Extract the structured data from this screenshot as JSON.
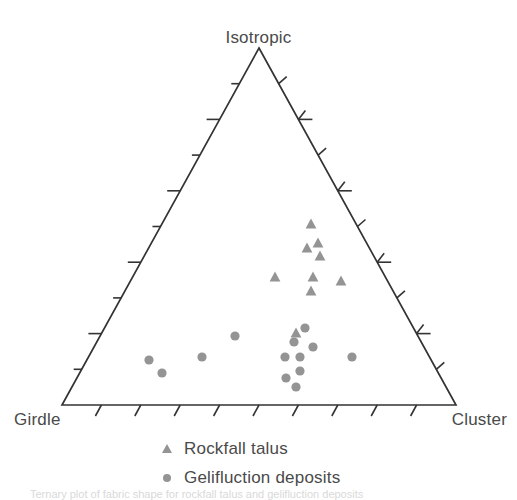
{
  "figure": {
    "type": "ternary-scatter",
    "vertices": {
      "top": "Isotropic",
      "bottom_left": "Girdle",
      "bottom_right": "Cluster"
    },
    "caption_partial": "Ternary plot of fabric shape for rockfall talus and gelifluction deposits"
  },
  "legend": {
    "items": [
      {
        "marker": "triangle-marker",
        "label": "Rockfall talus",
        "color": "#949494"
      },
      {
        "marker": "circle-marker",
        "label": "Gelifluction deposits",
        "color": "#949494"
      }
    ]
  },
  "style": {
    "axis_color": "#333333",
    "marker_gray": "#949494",
    "text_gray": "#4a4a4a",
    "background": "#ffffff"
  },
  "chart_data": {
    "type": "scatter",
    "plot_kind": "ternary",
    "title": "",
    "axis_labels": {
      "top": "Isotropic",
      "left": "Girdle",
      "right": "Cluster"
    },
    "axis_ranges": {
      "isotropic": [
        0,
        1
      ],
      "girdle": [
        0,
        1
      ],
      "cluster": [
        0,
        1
      ]
    },
    "ticks": {
      "count_per_edge": 9,
      "left_edge_style": "horizontal",
      "right_edge_style": "alternating-long-short",
      "bottom_edge_style": "slanted"
    },
    "grid": false,
    "legend_position": "bottom-center",
    "geometry_px": {
      "apex": [
        259,
        48
      ],
      "bottom_left": [
        62,
        405
      ],
      "bottom_right": [
        456,
        405
      ]
    },
    "series": [
      {
        "name": "Rockfall talus",
        "marker": "triangle",
        "color": "#949494",
        "points_px": [
          [
            311,
            224
          ],
          [
            318,
            243
          ],
          [
            307,
            248
          ],
          [
            320,
            256
          ],
          [
            275,
            277
          ],
          [
            313,
            277
          ],
          [
            341,
            281
          ],
          [
            311,
            291
          ],
          [
            296,
            333
          ]
        ],
        "points_ternary": [
          {
            "isotropic": 0.5,
            "girdle": 0.23,
            "cluster": 0.27
          },
          {
            "isotropic": 0.45,
            "girdle": 0.22,
            "cluster": 0.33
          },
          {
            "isotropic": 0.44,
            "girdle": 0.26,
            "cluster": 0.3
          },
          {
            "isotropic": 0.42,
            "girdle": 0.22,
            "cluster": 0.36
          },
          {
            "isotropic": 0.36,
            "girdle": 0.37,
            "cluster": 0.27
          },
          {
            "isotropic": 0.36,
            "girdle": 0.26,
            "cluster": 0.38
          },
          {
            "isotropic": 0.35,
            "girdle": 0.18,
            "cluster": 0.47
          },
          {
            "isotropic": 0.32,
            "girdle": 0.28,
            "cluster": 0.4
          },
          {
            "isotropic": 0.2,
            "girdle": 0.32,
            "cluster": 0.48
          }
        ]
      },
      {
        "name": "Gelifluction deposits",
        "marker": "circle",
        "color": "#949494",
        "points_px": [
          [
            149,
            360
          ],
          [
            162,
            373
          ],
          [
            202,
            357
          ],
          [
            235,
            336
          ],
          [
            305,
            328
          ],
          [
            294,
            342
          ],
          [
            313,
            347
          ],
          [
            285,
            357
          ],
          [
            300,
            357
          ],
          [
            352,
            357
          ],
          [
            286,
            378
          ],
          [
            300,
            371
          ],
          [
            296,
            387
          ]
        ],
        "points_ternary": [
          {
            "isotropic": 0.13,
            "girdle": 0.74,
            "cluster": 0.13
          },
          {
            "isotropic": 0.09,
            "girdle": 0.72,
            "cluster": 0.19
          },
          {
            "isotropic": 0.13,
            "girdle": 0.61,
            "cluster": 0.26
          },
          {
            "isotropic": 0.19,
            "girdle": 0.52,
            "cluster": 0.29
          },
          {
            "isotropic": 0.22,
            "girdle": 0.36,
            "cluster": 0.42
          },
          {
            "isotropic": 0.18,
            "girdle": 0.4,
            "cluster": 0.42
          },
          {
            "isotropic": 0.16,
            "girdle": 0.34,
            "cluster": 0.5
          },
          {
            "isotropic": 0.13,
            "girdle": 0.43,
            "cluster": 0.44
          },
          {
            "isotropic": 0.13,
            "girdle": 0.39,
            "cluster": 0.48
          },
          {
            "isotropic": 0.13,
            "girdle": 0.26,
            "cluster": 0.61
          },
          {
            "isotropic": 0.08,
            "girdle": 0.43,
            "cluster": 0.49
          },
          {
            "isotropic": 0.1,
            "girdle": 0.39,
            "cluster": 0.51
          },
          {
            "isotropic": 0.05,
            "girdle": 0.41,
            "cluster": 0.54
          }
        ]
      }
    ]
  }
}
